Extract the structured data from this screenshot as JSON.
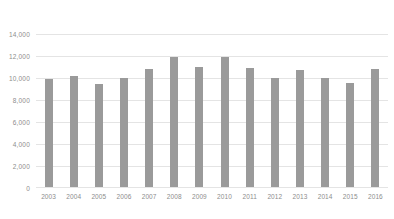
{
  "chart_data": {
    "type": "bar",
    "title": "",
    "xlabel": "",
    "ylabel": "",
    "categories": [
      "2003",
      "2004",
      "2005",
      "2006",
      "2007",
      "2008",
      "2009",
      "2010",
      "2011",
      "2012",
      "2013",
      "2014",
      "2015",
      "2016"
    ],
    "values": [
      9800,
      10100,
      9400,
      9900,
      10700,
      11800,
      10900,
      11800,
      10800,
      9950,
      10600,
      9950,
      9500,
      10700
    ],
    "series": [
      {
        "name": "",
        "values": [
          9800,
          10100,
          9400,
          9900,
          10700,
          11800,
          10900,
          11800,
          10800,
          9950,
          10600,
          9950,
          9500,
          10700
        ]
      }
    ],
    "ylim": [
      0,
      14000
    ],
    "ytick_values": [
      14000,
      12000,
      10000,
      8000,
      6000,
      4000,
      2000,
      0
    ],
    "ytick_labels": [
      "14,000",
      "12,000",
      "10,000",
      "8,000",
      "6,000",
      "4,000",
      "2,000",
      "0"
    ],
    "grid": "horizontal",
    "legend": "none",
    "bar_color": "#9a9a9a",
    "gridline_color": "#e4e4e4",
    "tick_label_color": "#8d8d8d"
  }
}
